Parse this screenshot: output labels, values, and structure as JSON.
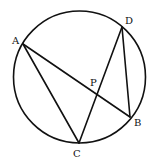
{
  "diagram": {
    "type": "circle-geometry",
    "stroke_color": "#111111",
    "background_color": "#ffffff",
    "points": {
      "A": {
        "label": "A",
        "on_circle": true
      },
      "B": {
        "label": "B",
        "on_circle": true
      },
      "C": {
        "label": "C",
        "on_circle": true
      },
      "D": {
        "label": "D",
        "on_circle": true
      },
      "P": {
        "label": "P",
        "on_circle": false,
        "note": "intersection of AB and CD"
      }
    },
    "segments": [
      {
        "from": "A",
        "to": "B"
      },
      {
        "from": "A",
        "to": "C"
      },
      {
        "from": "C",
        "to": "D"
      },
      {
        "from": "D",
        "to": "B"
      }
    ]
  }
}
